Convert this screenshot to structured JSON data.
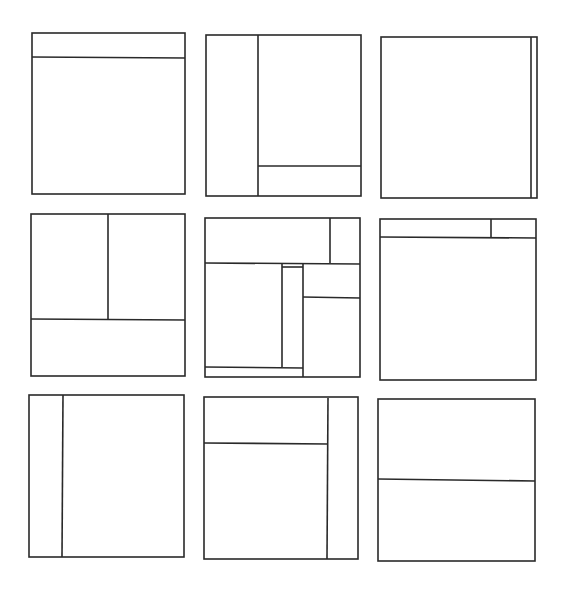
{
  "diagram": {
    "title": "",
    "stroke_color": "#2a2a2a",
    "background_color": "#ffffff",
    "stroke_width": 1.6,
    "panels": [
      {
        "id": "layout-1",
        "name": "header-top-layout",
        "frame": {
          "x": 32,
          "y": 33,
          "w": 153,
          "h": 161
        },
        "lines": [
          {
            "x1": 32,
            "y1": 57,
            "x2": 185,
            "y2": 58
          }
        ]
      },
      {
        "id": "layout-2",
        "name": "left-sidebar-bottom-right-panel-layout",
        "frame": {
          "x": 206,
          "y": 35,
          "w": 155,
          "h": 161
        },
        "lines": [
          {
            "x1": 258,
            "y1": 35,
            "x2": 258,
            "y2": 196
          },
          {
            "x1": 258,
            "y1": 166,
            "x2": 361,
            "y2": 166
          }
        ]
      },
      {
        "id": "layout-3",
        "name": "thin-right-scrollbar-layout",
        "frame": {
          "x": 381,
          "y": 37,
          "w": 156,
          "h": 161
        },
        "lines": [
          {
            "x1": 531,
            "y1": 37,
            "x2": 531,
            "y2": 198
          }
        ]
      },
      {
        "id": "layout-4",
        "name": "two-columns-over-footer-layout",
        "frame": {
          "x": 31,
          "y": 214,
          "w": 154,
          "h": 162
        },
        "lines": [
          {
            "x1": 108,
            "y1": 214,
            "x2": 108,
            "y2": 319
          },
          {
            "x1": 31,
            "y1": 319,
            "x2": 185,
            "y2": 320
          }
        ]
      },
      {
        "id": "layout-5",
        "name": "complex-multi-pane-layout",
        "frame": {
          "x": 205,
          "y": 218,
          "w": 155,
          "h": 159
        },
        "lines": [
          {
            "x1": 205,
            "y1": 263,
            "x2": 360,
            "y2": 264
          },
          {
            "x1": 330,
            "y1": 218,
            "x2": 330,
            "y2": 263
          },
          {
            "x1": 282,
            "y1": 264,
            "x2": 282,
            "y2": 367
          },
          {
            "x1": 303,
            "y1": 264,
            "x2": 303,
            "y2": 377
          },
          {
            "x1": 282,
            "y1": 267,
            "x2": 303,
            "y2": 267
          },
          {
            "x1": 303,
            "y1": 297,
            "x2": 360,
            "y2": 298
          },
          {
            "x1": 205,
            "y1": 367,
            "x2": 303,
            "y2": 368
          }
        ]
      },
      {
        "id": "layout-6",
        "name": "header-with-right-corner-box-layout",
        "frame": {
          "x": 380,
          "y": 219,
          "w": 156,
          "h": 161
        },
        "lines": [
          {
            "x1": 380,
            "y1": 237,
            "x2": 536,
            "y2": 238
          },
          {
            "x1": 491,
            "y1": 219,
            "x2": 491,
            "y2": 237
          }
        ]
      },
      {
        "id": "layout-7",
        "name": "narrow-left-sidebar-layout",
        "frame": {
          "x": 29,
          "y": 395,
          "w": 155,
          "h": 162
        },
        "lines": [
          {
            "x1": 63,
            "y1": 395,
            "x2": 62,
            "y2": 557
          }
        ]
      },
      {
        "id": "layout-8",
        "name": "right-sidebar-with-top-header-layout",
        "frame": {
          "x": 204,
          "y": 397,
          "w": 154,
          "h": 162
        },
        "lines": [
          {
            "x1": 328,
            "y1": 398,
            "x2": 327,
            "y2": 559
          },
          {
            "x1": 204,
            "y1": 443,
            "x2": 328,
            "y2": 444
          }
        ]
      },
      {
        "id": "layout-9",
        "name": "horizontal-split-layout",
        "frame": {
          "x": 378,
          "y": 399,
          "w": 157,
          "h": 162
        },
        "lines": [
          {
            "x1": 378,
            "y1": 479,
            "x2": 535,
            "y2": 481
          }
        ]
      }
    ]
  }
}
